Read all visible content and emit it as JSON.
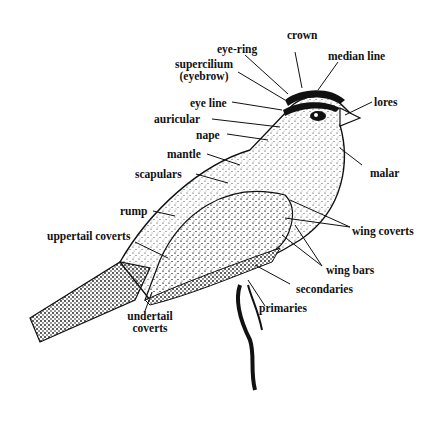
{
  "diagram": {
    "labels": {
      "crown": "crown",
      "eye_ring": "eye-ring",
      "median_line": "median line",
      "supercilium": "supercilium",
      "supercilium_alt": "(eyebrow)",
      "eye_line": "eye line",
      "lores": "lores",
      "auricular": "auricular",
      "nape": "nape",
      "mantle": "mantle",
      "malar": "malar",
      "scapulars": "scapulars",
      "rump": "rump",
      "wing_coverts": "wing coverts",
      "uppertail_coverts": "uppertail coverts",
      "wing_bars": "wing bars",
      "secondaries": "secondaries",
      "primaries": "primaries",
      "undertail_coverts_1": "undertail",
      "undertail_coverts_2": "coverts"
    },
    "colors": {
      "ink": "#111111",
      "background": "#ffffff"
    }
  }
}
